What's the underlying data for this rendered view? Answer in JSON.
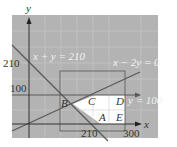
{
  "figure": {
    "type": "linear-programming-feasible-region",
    "colors": {
      "background": "#ffffff",
      "shaded_region": "#b3b3b3",
      "grid": "#c4c4c4",
      "feasible_region": "#ffffff",
      "line": "#595959",
      "axis": "#333333"
    },
    "axes": {
      "x_label": "x",
      "y_label": "y",
      "x_ticks": [
        "210",
        "300"
      ],
      "y_ticks": [
        "210",
        "100"
      ]
    },
    "lines": [
      {
        "id": "line-1",
        "label": "x + y = 210"
      },
      {
        "id": "line-2",
        "label": "x − 2y = 0"
      },
      {
        "id": "line-3",
        "label": "y = 100"
      }
    ],
    "points": {
      "A": "A",
      "B": "B",
      "C": "C",
      "D": "D",
      "E": "E"
    }
  }
}
